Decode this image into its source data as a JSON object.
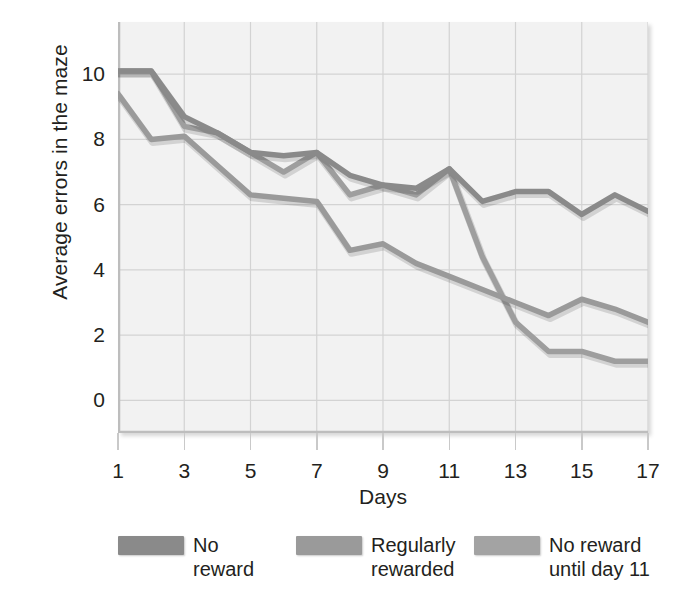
{
  "chart_data": {
    "type": "line",
    "title": "",
    "xlabel": "Days",
    "ylabel": "Average errors in the maze",
    "xlim": [
      1,
      17
    ],
    "ylim": [
      -1,
      11.6
    ],
    "grid": true,
    "legend_position": "bottom",
    "x": [
      1,
      2,
      3,
      4,
      5,
      6,
      7,
      8,
      9,
      10,
      11,
      12,
      13,
      14,
      15,
      16,
      17
    ],
    "xticks": [
      "1",
      "3",
      "5",
      "7",
      "9",
      "11",
      "13",
      "15",
      "17"
    ],
    "xtick_values": [
      1,
      3,
      5,
      7,
      9,
      11,
      13,
      15,
      17
    ],
    "yticks": [
      "0",
      "2",
      "4",
      "6",
      "8",
      "10"
    ],
    "ytick_values": [
      0,
      2,
      4,
      6,
      8,
      10
    ],
    "series": [
      {
        "name": "No reward",
        "color": "#8a8a8a",
        "values": [
          10.1,
          10.1,
          8.7,
          8.2,
          7.6,
          7.5,
          7.6,
          6.9,
          6.6,
          6.5,
          7.1,
          6.1,
          6.4,
          6.4,
          5.7,
          6.3,
          5.8
        ]
      },
      {
        "name": "Regularly rewarded",
        "color": "#9a9a9a",
        "values": [
          9.4,
          8.0,
          8.1,
          7.2,
          6.3,
          6.2,
          6.1,
          4.6,
          4.8,
          4.2,
          3.8,
          3.4,
          3.0,
          2.6,
          3.1,
          2.8,
          2.4
        ]
      },
      {
        "name": "No reward until day 11",
        "color": "#9e9e9e",
        "values": [
          10.1,
          10.1,
          8.4,
          8.2,
          7.6,
          7.0,
          7.6,
          6.3,
          6.6,
          6.3,
          7.1,
          4.4,
          2.4,
          1.5,
          1.5,
          1.2,
          1.2
        ]
      }
    ]
  },
  "legend": {
    "entries": [
      {
        "label": "No\nreward",
        "color": "#8a8a8a"
      },
      {
        "label": "Regularly\nrewarded",
        "color": "#9a9a9a"
      },
      {
        "label": "No reward\nuntil day 11",
        "color": "#a3a3a3"
      }
    ]
  },
  "axes": {
    "x_title": "Days",
    "y_title": "Average errors in the maze"
  },
  "colors": {
    "plot_background": "#f2f2f2",
    "page_background": "#ffffff",
    "gridline": "#d3d3d3",
    "axis_line": "#c4c4c4",
    "text": "#231f20"
  }
}
